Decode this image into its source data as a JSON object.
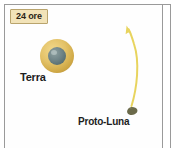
{
  "figure": {
    "name": "terra-proto-luna-formation-panel",
    "caption_box": {
      "text": "24 ore",
      "background_color": "#f2e3b8",
      "border_color": "#b9a46d",
      "text_color": "#2a2317"
    },
    "background_color": "#fefefe",
    "frame_color": "#9a9a9a"
  },
  "bodies": [
    {
      "id": "earth",
      "label": "Terra",
      "halo_color": "#e3c268",
      "core_color": "#6f8487",
      "center": {
        "x": 57,
        "y": 56
      },
      "halo_diameter": 34,
      "core_diameter": 18
    },
    {
      "id": "proto-moon",
      "label": "Proto-Luna",
      "body_color": "#6b6a4a",
      "center": {
        "x": 132,
        "y": 111
      },
      "width": 12,
      "height": 10
    }
  ],
  "labels": {
    "earth": "Terra",
    "proto_moon": "Proto-Luna"
  },
  "trajectory": {
    "name": "proto-moon-trajectory-arrow",
    "color": "#e8d45e",
    "direction": "upward",
    "start": {
      "x": 131,
      "y": 106
    },
    "end": {
      "x": 128,
      "y": 28
    }
  }
}
